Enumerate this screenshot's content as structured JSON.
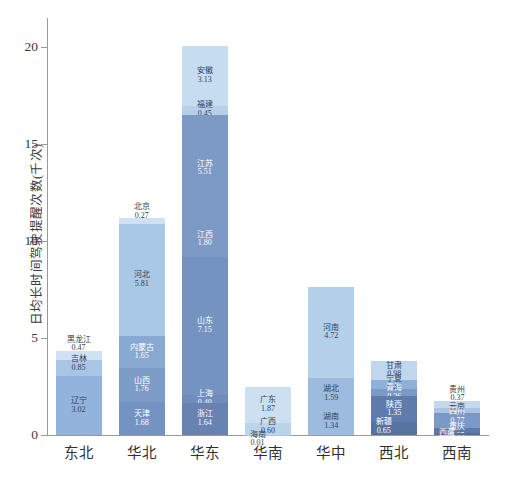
{
  "chart_data": {
    "type": "bar",
    "subtype": "stacked",
    "title": "",
    "xlabel": "",
    "ylabel": "日均长时间驾驶提醒次数(千次)",
    "ylim": [
      0,
      21.5
    ],
    "yticks": [
      0,
      5,
      10,
      15,
      20
    ],
    "grid": false,
    "legend": "none",
    "categories": [
      "东北",
      "华北",
      "华东",
      "华南",
      "华中",
      "西北",
      "西南"
    ],
    "groups": [
      {
        "category": "东北",
        "total": 4.34,
        "segments": [
          {
            "label": "黑龙江",
            "value": 0.47,
            "color": "#cfe1f2"
          },
          {
            "label": "吉林",
            "value": 0.85,
            "color": "#a8c6e4"
          },
          {
            "label": "辽宁",
            "value": 3.02,
            "color": "#92b3dc"
          }
        ]
      },
      {
        "category": "华北",
        "total": 11.17,
        "segments": [
          {
            "label": "北京",
            "value": 0.27,
            "color": "#cfe1f2"
          },
          {
            "label": "河北",
            "value": 5.81,
            "color": "#a9c7e6"
          },
          {
            "label": "内蒙古",
            "value": 1.65,
            "color": "#8aa9d2"
          },
          {
            "label": "山西",
            "value": 1.76,
            "color": "#7e9cc8"
          },
          {
            "label": "天津",
            "value": 1.68,
            "color": "#7493c2"
          }
        ]
      },
      {
        "category": "华东",
        "total": 20.08,
        "segments": [
          {
            "label": "安徽",
            "value": 3.13,
            "color": "#c6dcf1"
          },
          {
            "label": "福建",
            "value": 0.45,
            "color": "#b7cfe8"
          },
          {
            "label": "江苏",
            "value": 5.51,
            "color": "#7d9ac6"
          },
          {
            "label": "江西",
            "value": 1.8,
            "color": "#7d9ac6"
          },
          {
            "label": "山东",
            "value": 7.15,
            "color": "#7593c1"
          },
          {
            "label": "上海",
            "value": 0.4,
            "color": "#6f8cbb"
          },
          {
            "label": "浙江",
            "value": 1.64,
            "color": "#6882b2"
          }
        ]
      },
      {
        "category": "华南",
        "total": 2.48,
        "segments": [
          {
            "label": "广东",
            "value": 1.87,
            "color": "#cce0f2"
          },
          {
            "label": "广西",
            "value": 0.6,
            "color": "#bad4ec"
          },
          {
            "label": "海南",
            "value": 0.01,
            "color": "#a9c7e6"
          }
        ]
      },
      {
        "category": "华中",
        "total": 7.65,
        "segments": [
          {
            "label": "河南",
            "value": 4.72,
            "color": "#b4cfea"
          },
          {
            "label": "湖北",
            "value": 1.59,
            "color": "#9dbbde"
          },
          {
            "label": "湖南",
            "value": 1.34,
            "color": "#9dbbde"
          }
        ]
      },
      {
        "category": "西北",
        "total": 3.82,
        "segments": [
          {
            "label": "甘肃",
            "value": 0.98,
            "color": "#bfd6ed"
          },
          {
            "label": "宁夏",
            "value": 0.48,
            "color": "#8fb0d8"
          },
          {
            "label": "青海",
            "value": 0.36,
            "color": "#7d9ac6"
          },
          {
            "label": "陕西",
            "value": 1.35,
            "color": "#5f7bab"
          },
          {
            "label": "新疆",
            "value": 0.65,
            "color": "#56729f"
          }
        ]
      },
      {
        "category": "西南",
        "total": 1.76,
        "segments": [
          {
            "label": "贵州",
            "value": 0.37,
            "color": "#c3d9ee"
          },
          {
            "label": "云南",
            "value": 0.28,
            "color": "#a7c4e3"
          },
          {
            "label": "四川",
            "value": 0.77,
            "color": "#7b99c6"
          },
          {
            "label": "重庆",
            "value": 0.25,
            "color": "#5d79a9"
          },
          {
            "label": "西藏",
            "value": 0.09,
            "color": "#55709d"
          }
        ]
      }
    ]
  }
}
